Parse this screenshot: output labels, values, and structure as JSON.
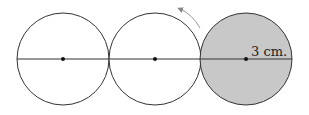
{
  "diagram": {
    "type": "rolling-circle",
    "circles": [
      {
        "cx": 63,
        "cy": 59,
        "r": 46,
        "fill": "#ffffff"
      },
      {
        "cx": 155,
        "cy": 59,
        "r": 46,
        "fill": "#ffffff"
      },
      {
        "cx": 246,
        "cy": 59,
        "r": 46,
        "fill": "#c8c8c8"
      }
    ],
    "radius_label": "3 cm.",
    "line_color": "#333333",
    "arrow_color": "#888888"
  }
}
